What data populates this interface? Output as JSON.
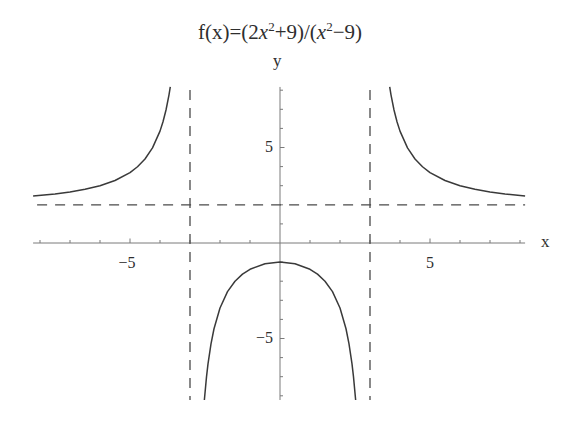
{
  "chart_data": {
    "type": "line",
    "title_segments": [
      {
        "t": "f(x)=(2"
      },
      {
        "t": "x",
        "italic": true
      },
      {
        "t": "2",
        "sup": true
      },
      {
        "t": "+9)/("
      },
      {
        "t": "x",
        "italic": true
      },
      {
        "t": "2",
        "sup": true
      },
      {
        "t": "−9)"
      }
    ],
    "xlabel": "x",
    "ylabel": "y",
    "xlim": [
      -8.23,
      8.17
    ],
    "ylim": [
      -8.22,
      8.17
    ],
    "grid": false,
    "legend": null,
    "x_ticks": [
      -8,
      -7,
      -6,
      -5,
      -4,
      -3,
      -2,
      -1,
      1,
      2,
      3,
      4,
      5,
      6,
      7,
      8
    ],
    "x_tick_labels": [
      {
        "value": -5,
        "label": "−5"
      },
      {
        "value": 5,
        "label": "5"
      }
    ],
    "y_ticks": [
      -8,
      -7,
      -6,
      -5,
      -4,
      -3,
      -2,
      -1,
      1,
      2,
      3,
      4,
      5,
      6,
      7,
      8
    ],
    "y_tick_labels": [
      {
        "value": 5,
        "label": "5"
      },
      {
        "value": -5,
        "label": "−5"
      }
    ],
    "asymptotes": [
      {
        "type": "vertical",
        "x": -3
      },
      {
        "type": "vertical",
        "x": 3
      },
      {
        "type": "horizontal",
        "y": 2
      }
    ],
    "series": [
      {
        "name": "left branch (x < -3)",
        "x": [
          -8.23,
          -7.5,
          -7,
          -6.5,
          -6,
          -5.5,
          -5,
          -4.75,
          -4.5,
          -4.25,
          -4,
          -3.9,
          -3.8,
          -3.7,
          -3.657
        ],
        "y": [
          2.46,
          2.571,
          2.675,
          2.812,
          3.0,
          3.271,
          3.688,
          3.991,
          4.4,
          4.979,
          5.857,
          6.348,
          6.963,
          7.757,
          8.17
        ]
      },
      {
        "name": "middle branch (-3 < x < 3)",
        "x": [
          -2.5215,
          -2.45,
          -2.4,
          -2.3,
          -2.2,
          -2,
          -1.75,
          -1.5,
          -1.25,
          -1,
          -0.5,
          0,
          0.5,
          1,
          1.25,
          1.5,
          1.75,
          2,
          2.2,
          2.3,
          2.4,
          2.45,
          2.5215
        ],
        "y": [
          -8.22,
          -7.008,
          -6.333,
          -5.278,
          -4.49,
          -3.4,
          -2.547,
          -2.0,
          -1.63,
          -1.375,
          -1.086,
          -1.0,
          -1.086,
          -1.375,
          -1.63,
          -2.0,
          -2.547,
          -3.4,
          -4.49,
          -5.278,
          -6.333,
          -7.008,
          -8.22
        ]
      },
      {
        "name": "right branch (x > 3)",
        "x": [
          3.657,
          3.7,
          3.8,
          3.9,
          4,
          4.25,
          4.5,
          4.75,
          5,
          5.5,
          6,
          6.5,
          7,
          7.5,
          8.17
        ],
        "y": [
          8.17,
          7.757,
          6.963,
          6.348,
          5.857,
          4.979,
          4.4,
          3.991,
          3.688,
          3.271,
          3.0,
          2.812,
          2.675,
          2.571,
          2.463
        ]
      }
    ],
    "colors": {
      "curve": "#3a3a3a",
      "axis": "#7a7a7a",
      "asymptote": "#4a4a4a",
      "text": "#2e2e2e"
    }
  }
}
